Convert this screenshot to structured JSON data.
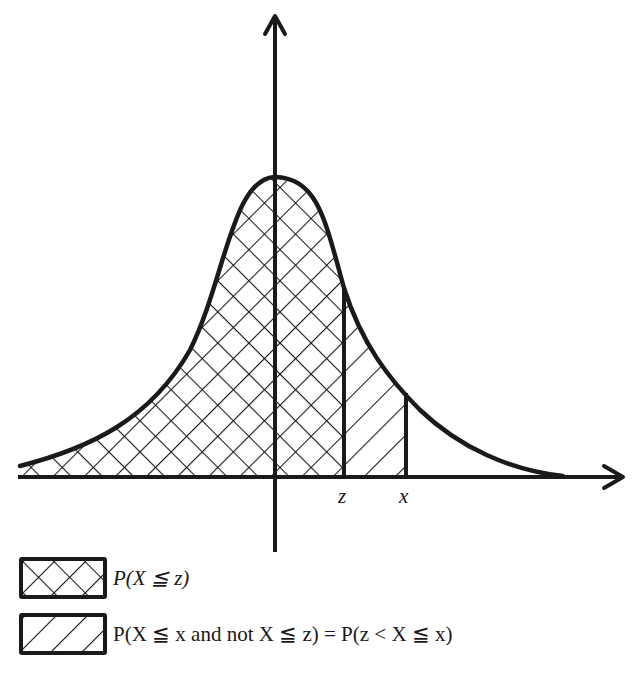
{
  "figure": {
    "type": "normal-distribution-cdf-illustration",
    "curve": "bell-curve",
    "axes": {
      "x_axis_arrow": true,
      "y_axis_arrow": true
    },
    "axis_labels": {
      "z": "z",
      "x": "x"
    },
    "regions": [
      {
        "name": "left-of-z",
        "hatch": "cross-hatch",
        "represents": "P(X ≦ z)"
      },
      {
        "name": "between-z-and-x",
        "hatch": "diagonal-hatch",
        "represents": "P(z < X ≦ x)"
      }
    ],
    "colors": {
      "ink": "#1a1a1a",
      "background": "#ffffff"
    }
  },
  "legend": {
    "items": [
      {
        "swatch": "cross-hatch",
        "label": "P(X ≦ z)"
      },
      {
        "swatch": "diagonal-hatch",
        "label": "P(X ≦ x and not X ≦ z) = P(z < X ≦ x)"
      }
    ]
  }
}
